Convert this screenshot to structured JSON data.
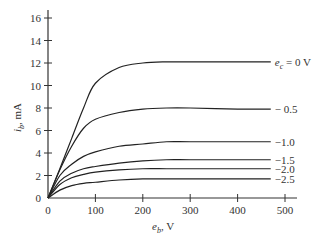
{
  "chart_data": {
    "type": "line",
    "title": "",
    "xlabel": "e_b, V",
    "ylabel": "i_b, mA",
    "xlim": [
      0,
      500
    ],
    "ylim": [
      0,
      16
    ],
    "x_ticks": [
      0,
      100,
      200,
      300,
      400,
      500
    ],
    "y_ticks": [
      0,
      2,
      4,
      6,
      8,
      10,
      12,
      14,
      16
    ],
    "grid": false,
    "legend": "inline labels at right end of curves",
    "x": [
      0,
      25,
      50,
      75,
      100,
      150,
      200,
      250,
      300,
      400,
      470
    ],
    "series": [
      {
        "name": "e_c = 0 V",
        "label": "e_c = 0 V",
        "values": [
          0,
          2.6,
          5.3,
          8.0,
          10.2,
          11.6,
          12.0,
          12.1,
          12.1,
          12.1,
          12.1
        ]
      },
      {
        "name": "-0.5",
        "label": "− 0.5",
        "values": [
          0,
          2.5,
          4.6,
          6.2,
          7.0,
          7.6,
          7.9,
          8.0,
          8.0,
          7.9,
          7.9
        ]
      },
      {
        "name": "-1.0",
        "label": "−1.0",
        "values": [
          0,
          2.0,
          3.0,
          3.7,
          4.1,
          4.6,
          4.8,
          5.0,
          5.0,
          5.0,
          5.0
        ]
      },
      {
        "name": "-1.5",
        "label": "−1.5",
        "values": [
          0,
          1.5,
          2.2,
          2.6,
          2.8,
          3.1,
          3.3,
          3.4,
          3.4,
          3.4,
          3.4
        ]
      },
      {
        "name": "-2.0",
        "label": "−2.0",
        "values": [
          0,
          1.2,
          1.8,
          2.1,
          2.3,
          2.5,
          2.6,
          2.6,
          2.6,
          2.6,
          2.6
        ]
      },
      {
        "name": "-2.5",
        "label": "−2.5",
        "values": [
          0,
          0.7,
          1.1,
          1.3,
          1.4,
          1.6,
          1.7,
          1.7,
          1.7,
          1.7,
          1.7
        ]
      }
    ]
  },
  "axes": {
    "xlabel_main": "e",
    "xlabel_sub": "b",
    "xlabel_unit": ", V",
    "ylabel_main": "i",
    "ylabel_sub": "b",
    "ylabel_unit": ", mA"
  }
}
